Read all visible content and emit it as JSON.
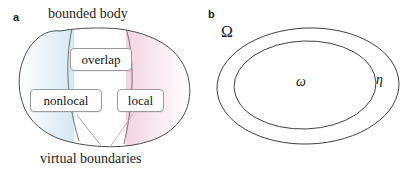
{
  "figure": {
    "width": 406,
    "height": 173,
    "background": "#ffffff"
  },
  "panel_a": {
    "label": "a",
    "title": "bounded body",
    "caption": "virtual boundaries",
    "boxes": [
      {
        "id": "overlap",
        "label": "overlap"
      },
      {
        "id": "nonlocal",
        "label": "nonlocal"
      },
      {
        "id": "local",
        "label": "local"
      }
    ],
    "region_tints": {
      "nonlocal_tint": "#cfe4f2",
      "local_tint": "#f4d6e2",
      "overlap_tint": "#ffffff"
    },
    "outline_color": "#3a3a3a",
    "leader_line_colors": [
      "#8f8fa3",
      "#c89aa8"
    ]
  },
  "panel_b": {
    "label": "b",
    "symbols": [
      {
        "id": "domain-omega-upper",
        "glyph": "Ω"
      },
      {
        "id": "subdomain-omega-lower",
        "glyph": "ω"
      },
      {
        "id": "collar-eta",
        "glyph": "η"
      }
    ],
    "outline_color": "#2e2e2e"
  }
}
